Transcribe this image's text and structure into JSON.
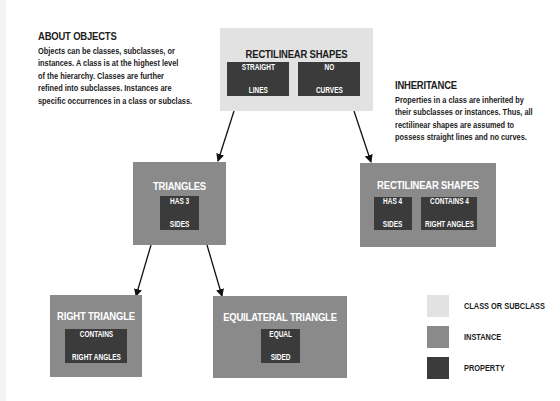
{
  "colors": {
    "class": "#e2e2e2",
    "instance": "#8a8a8a",
    "property": "#3b3b3b",
    "arrow": "#111111"
  },
  "notes": {
    "about": {
      "title": "ABOUT OBJECTS",
      "lines": [
        "Objects can be classes, subclasses, or",
        "instances. A class is at the highest level",
        "of the hierarchy. Classes are further",
        "refined into subclasses. Instances are",
        "specific occurrences in a class or subclass."
      ]
    },
    "inheritance": {
      "title": "INHERITANCE",
      "lines": [
        "Properties in a class are inherited by",
        "their subclasses or instances. Thus, all",
        "rectilinear shapes are assumed to",
        "possess straight lines and no curves."
      ]
    }
  },
  "nodes": {
    "root": {
      "title": "RECTILINEAR SHAPES",
      "kind": "class",
      "properties": [
        {
          "line1": "STRAIGHT",
          "line2": "LINES"
        },
        {
          "line1": "NO",
          "line2": "CURVES"
        }
      ]
    },
    "triangles": {
      "title": "TRIANGLES",
      "kind": "instance",
      "properties": [
        {
          "line1": "HAS 3",
          "line2": "SIDES"
        }
      ]
    },
    "rectilinear": {
      "title": "RECTILINEAR SHAPES",
      "kind": "instance",
      "properties": [
        {
          "line1": "HAS 4",
          "line2": "SIDES"
        },
        {
          "line1": "CONTAINS 4",
          "line2": "RIGHT ANGLES"
        }
      ]
    },
    "right_triangle": {
      "title": "RIGHT TRIANGLE",
      "kind": "instance",
      "properties": [
        {
          "line1": "CONTAINS",
          "line2": "RIGHT ANGLES"
        }
      ]
    },
    "equilateral": {
      "title": "EQUILATERAL TRIANGLE",
      "kind": "instance",
      "properties": [
        {
          "line1": "EQUAL",
          "line2": "SIDED"
        }
      ]
    }
  },
  "edges": [
    {
      "from": "root",
      "to": "triangles"
    },
    {
      "from": "root",
      "to": "rectilinear"
    },
    {
      "from": "triangles",
      "to": "right_triangle"
    },
    {
      "from": "triangles",
      "to": "equilateral"
    }
  ],
  "legend": [
    {
      "label": "CLASS OR SUBCLASS",
      "kind": "class"
    },
    {
      "label": "INSTANCE",
      "kind": "instance"
    },
    {
      "label": "PROPERTY",
      "kind": "property"
    }
  ]
}
